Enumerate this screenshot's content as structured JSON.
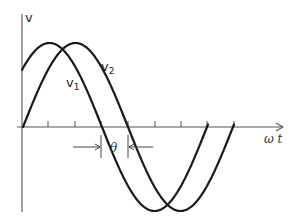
{
  "diagram": {
    "y_axis_label": "v",
    "x_axis_label": "ω t",
    "phase_label": "θ",
    "curves": [
      {
        "id": "v1",
        "label": "v",
        "subscript": "1",
        "leads_by": "θ"
      },
      {
        "id": "v2",
        "label": "v",
        "subscript": "2",
        "starts_at_origin": true
      }
    ],
    "colors": {
      "curve": "#1a1a1a",
      "axis": "#555555",
      "background": "#ffffff"
    }
  },
  "geometry": {
    "origin_x": 22,
    "axis_y": 127,
    "axis_top": 14,
    "axis_bottom": 212,
    "axis_left": 17,
    "axis_right": 283,
    "amplitude": 84,
    "period_px": 210,
    "v2_zero_x": 23,
    "phase_shift_px": 26,
    "v1_end_x": 208,
    "v2_end_x": 234,
    "ticks_x": [
      48,
      75,
      101,
      128,
      155,
      181,
      207,
      234
    ],
    "tick_height": 6
  }
}
